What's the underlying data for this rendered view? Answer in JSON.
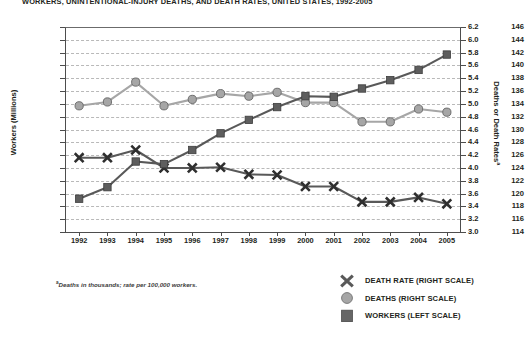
{
  "title": "WORKERS, UNINTENTIONAL-INJURY DEATHS, AND DEATH RATES, UNITED STATES, 1992-2005",
  "footnote": "Deaths in thousands; rate per 100,000 workers.",
  "footnote_marker": "a",
  "axes": {
    "left_title": "Workers (Millions)",
    "right_title": "Deaths or Death Rates",
    "right_title_marker": "a",
    "left_ticks": [
      "146",
      "144",
      "142",
      "140",
      "138",
      "136",
      "134",
      "132",
      "130",
      "128",
      "126",
      "124",
      "122",
      "120",
      "118",
      "116",
      "114"
    ],
    "right_ticks": [
      "6.2",
      "6.0",
      "5.8",
      "5.6",
      "5.4",
      "5.2",
      "5.0",
      "4.8",
      "4.6",
      "4.4",
      "4.2",
      "4.0",
      "3.8",
      "3.6",
      "3.4",
      "3.2",
      "3.0"
    ],
    "x_ticks": [
      "1992",
      "1993",
      "1994",
      "1995",
      "1996",
      "1997",
      "1998",
      "1999",
      "2000",
      "2001",
      "2002",
      "2003",
      "2004",
      "2005"
    ]
  },
  "legend": {
    "items": [
      {
        "label": "DEATH RATE (RIGHT SCALE)",
        "marker": "x-marker",
        "color": "#595959"
      },
      {
        "label": "DEATHS (RIGHT SCALE)",
        "marker": "circle-marker",
        "color": "#a6a6a6"
      },
      {
        "label": "WORKERS (LEFT SCALE)",
        "marker": "square-marker",
        "color": "#666666"
      }
    ]
  },
  "colors": {
    "death_rate": "#595959",
    "deaths": "#a6a6a6",
    "workers": "#595959",
    "grid": "#b9b9b9",
    "axis": "#4d4d4d",
    "text": "#231f20"
  },
  "chart_data": {
    "type": "line",
    "title": "WORKERS, UNINTENTIONAL-INJURY DEATHS, AND DEATH RATES, UNITED STATES, 1992-2005",
    "xlabel": "",
    "ylabel": "Workers (Millions)",
    "y2label": "Deaths or Death Rates",
    "grid": true,
    "legend_position": "bottom-right",
    "x": [
      1992,
      1993,
      1994,
      1995,
      1996,
      1997,
      1998,
      1999,
      2000,
      2001,
      2002,
      2003,
      2004,
      2005
    ],
    "ylim": [
      114,
      146
    ],
    "y2lim": [
      3.0,
      6.2
    ],
    "series": [
      {
        "name": "WORKERS (LEFT SCALE)",
        "axis": "left",
        "marker": "square",
        "color": "#595959",
        "values": [
          119.2,
          121.0,
          125.0,
          124.6,
          126.8,
          129.4,
          131.5,
          133.5,
          135.2,
          135.1,
          136.4,
          137.7,
          139.3,
          141.7
        ]
      },
      {
        "name": "DEATHS (RIGHT SCALE)",
        "axis": "right",
        "marker": "circle",
        "color": "#a6a6a6",
        "values": [
          4.97,
          5.03,
          5.34,
          4.97,
          5.07,
          5.16,
          5.12,
          5.18,
          5.02,
          5.02,
          4.72,
          4.72,
          4.92,
          4.87
        ]
      },
      {
        "name": "DEATH RATE (RIGHT SCALE)",
        "axis": "right",
        "marker": "x",
        "color": "#595959",
        "values": [
          4.16,
          4.16,
          4.28,
          4.0,
          4.0,
          4.01,
          3.9,
          3.89,
          3.71,
          3.71,
          3.47,
          3.47,
          3.54,
          3.44
        ]
      }
    ]
  }
}
